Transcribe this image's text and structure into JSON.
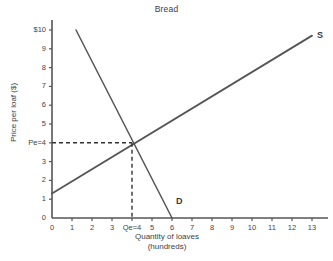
{
  "chart_data": {
    "type": "line",
    "title": "Bread",
    "xlabel": "Quantity of loaves",
    "xlabel_sub": "(hundreds)",
    "ylabel": "Price per loaf ($)",
    "xlim": [
      0,
      13.6
    ],
    "ylim": [
      0,
      10.4
    ],
    "grid": false,
    "legend": "inline-curve-labels",
    "x_ticks": [
      "0",
      "1",
      "2",
      "3",
      "Qe=4",
      "5",
      "6",
      "7",
      "8",
      "9",
      "10",
      "11",
      "12",
      "13"
    ],
    "x_tick_values": [
      0,
      1,
      2,
      3,
      4,
      5,
      6,
      7,
      8,
      9,
      10,
      11,
      12,
      13
    ],
    "y_ticks": [
      "0",
      "1",
      "2",
      "3",
      "Pe=4",
      "5",
      "6",
      "7",
      "8",
      "9",
      "$10"
    ],
    "y_tick_values": [
      0,
      1,
      2,
      3,
      4,
      5,
      6,
      7,
      8,
      9,
      10
    ],
    "series": [
      {
        "name": "S",
        "label": "S",
        "description": "Supply curve, upward sloping",
        "points": [
          [
            0,
            1.3
          ],
          [
            13,
            9.7
          ]
        ]
      },
      {
        "name": "D",
        "label": "D",
        "description": "Demand curve, downward sloping",
        "points": [
          [
            1.2,
            10.0
          ],
          [
            6,
            0
          ]
        ]
      }
    ],
    "equilibrium": {
      "price_label": "Pe=4",
      "quantity_label": "Qe=4",
      "price": 4,
      "quantity": 4,
      "guide_style": "dashed"
    },
    "colors": {
      "axis": "#555555",
      "supply": "#555555",
      "demand": "#555555",
      "guide": "#333333",
      "text": "#404040",
      "background": "#ffffff"
    }
  }
}
